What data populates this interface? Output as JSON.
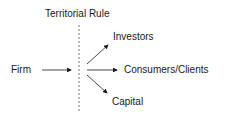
{
  "diagram": {
    "title": "Territorial Rule",
    "source": "Firm",
    "targets": [
      {
        "label": "Investors"
      },
      {
        "label": "Consumers/Clients"
      },
      {
        "label": "Capital"
      }
    ]
  }
}
